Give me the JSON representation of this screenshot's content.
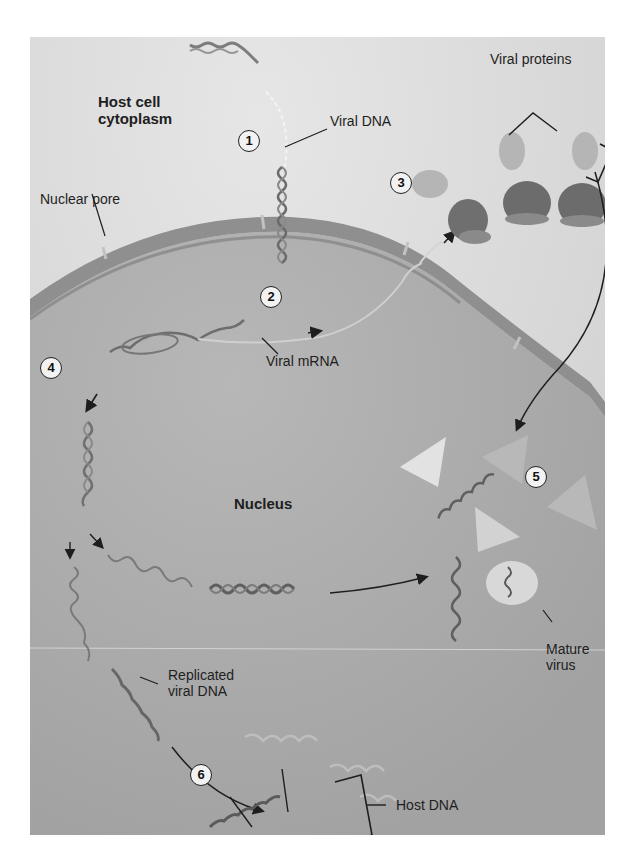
{
  "figure": {
    "colors": {
      "cytoplasm": "#dedede",
      "nucleus": "#a9a9a9",
      "envelope": "#8e8e8e",
      "dna": "#5a5a5a",
      "protein_dark": "#6e6e6e",
      "protein_light": "#b3b3b3",
      "capsid": "#d8d8d8",
      "ink": "#1e1e1e"
    }
  },
  "labels": {
    "host_cell_cytoplasm_line1": "Host cell",
    "host_cell_cytoplasm_line2": "cytoplasm",
    "viral_dna": "Viral DNA",
    "nuclear_pore": "Nuclear pore",
    "viral_proteins": "Viral proteins",
    "viral_mrna": "Viral mRNA",
    "nucleus": "Nucleus",
    "mature_virus_line1": "Mature",
    "mature_virus_line2": "virus",
    "replicated_viral_dna_line1": "Replicated",
    "replicated_viral_dna_line2": "viral DNA",
    "host_dna": "Host DNA"
  },
  "steps": [
    {
      "number": "1",
      "meaning": "viral DNA enters nucleus through pore"
    },
    {
      "number": "2",
      "meaning": "viral DNA transcribed to viral mRNA"
    },
    {
      "number": "3",
      "meaning": "viral mRNA translated into viral proteins"
    },
    {
      "number": "4",
      "meaning": "viral DNA replicated"
    },
    {
      "number": "5",
      "meaning": "viral proteins and DNA assemble into mature virus"
    },
    {
      "number": "6",
      "meaning": "replicated viral DNA integrates into host DNA"
    }
  ]
}
